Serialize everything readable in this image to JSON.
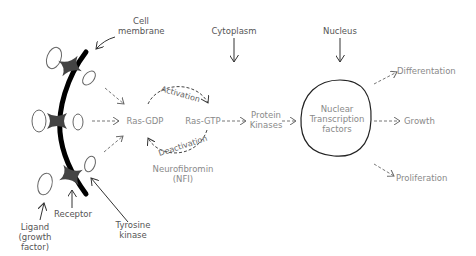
{
  "regions": {
    "cytoplasm": "Cytoplasm",
    "nucleus": "Nucleus"
  },
  "membrane": {
    "label_line1": "Cell",
    "label_line2": "membrane"
  },
  "components": {
    "receptor": "Receptor",
    "tyrosine_kinase_line1": "Tyrosine",
    "tyrosine_kinase_line2": "kinase",
    "ligand_line1": "Ligand",
    "ligand_line2": "(growth",
    "ligand_line3": "factor)"
  },
  "pathway": {
    "ras_gdp": "Ras-GDP",
    "ras_gtp": "Ras-GTP",
    "activation": "Activation",
    "deactivation": "Deactivation",
    "nf1_line1": "Neurofibromin",
    "nf1_line2": "(NFI)",
    "protein_kinases_line1": "Protein",
    "protein_kinases_line2": "Kinases",
    "ntf_line1": "Nuclear",
    "ntf_line2": "Transcription",
    "ntf_line3": "factors"
  },
  "outcomes": {
    "differentiation": "Differentation",
    "growth": "Growth",
    "proliferation": "Proliferation"
  },
  "colors": {
    "membrane": "#000000",
    "receptor": "#444444",
    "text": "#8a8a8a",
    "dark_text": "#555555",
    "arrow": "#777777"
  }
}
